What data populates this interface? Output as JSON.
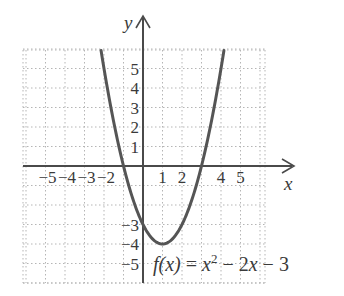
{
  "chart_data": {
    "type": "line",
    "title": "",
    "function_label": {
      "prefix_italic": "f(x)",
      "equals": " = ",
      "x1": "x",
      "exp": "2",
      "rest1": " − 2",
      "x2": "x",
      "rest2": " − 3"
    },
    "equation": "f(x) = x^2 - 2x - 3",
    "xlabel": "x",
    "ylabel": "y",
    "xlim": [
      -6,
      6
    ],
    "ylim": [
      -6,
      6
    ],
    "grid": true,
    "x_tick_labels": [
      "−5",
      "−4",
      "−3",
      "−2",
      "1",
      "2",
      "4",
      "5"
    ],
    "x_tick_values": [
      -5,
      -4,
      -3,
      -2,
      1,
      2,
      4,
      5
    ],
    "y_tick_labels": [
      "5",
      "4",
      "3",
      "2",
      "1",
      "−3",
      "−4",
      "−5"
    ],
    "y_tick_values": [
      5,
      4,
      3,
      2,
      1,
      -3,
      -4,
      -5
    ],
    "series": [
      {
        "name": "f(x) = x^2 - 2x - 3",
        "x": [
          -2.15,
          -2,
          -1.5,
          -1,
          -0.5,
          0,
          0.5,
          1,
          1.5,
          2,
          2.5,
          3,
          3.5,
          4,
          4.15
        ],
        "values": [
          5.92,
          5,
          2.25,
          0,
          -1.75,
          -3,
          -3.75,
          -4,
          -3.75,
          -3,
          -1.75,
          0,
          2.25,
          5,
          5.92
        ]
      }
    ],
    "key_points": {
      "vertex": [
        1,
        -4
      ],
      "y_intercept": [
        0,
        -3
      ],
      "x_intercepts": [
        [
          -1,
          0
        ],
        [
          3,
          0
        ]
      ]
    }
  }
}
